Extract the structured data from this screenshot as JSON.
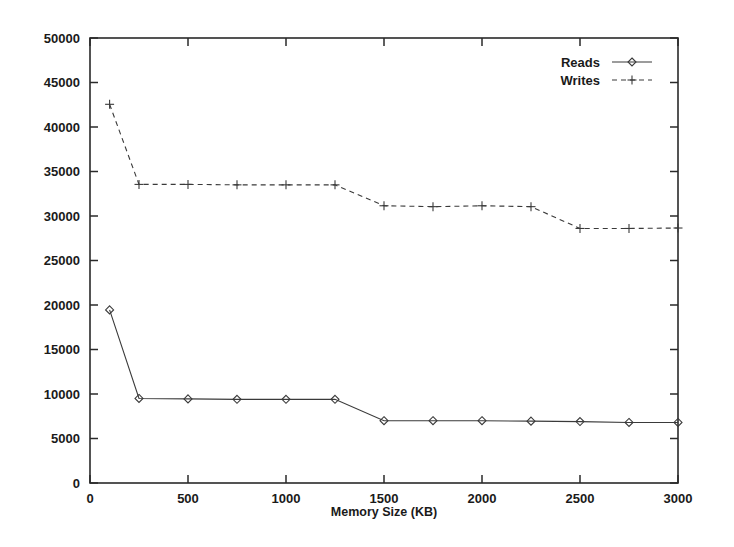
{
  "chart_data": {
    "type": "line",
    "title": "",
    "xlabel": "Memory Size (KB)",
    "ylabel": "",
    "xlim": [
      0,
      3000
    ],
    "ylim": [
      0,
      50000
    ],
    "grid": false,
    "legend_position": "top-right-inside",
    "xticks": [
      0,
      500,
      1000,
      1500,
      2000,
      2500,
      3000
    ],
    "xtick_labels": [
      "0",
      "500",
      "1000",
      "1500",
      "2000",
      "2500",
      "3000"
    ],
    "yticks": [
      0,
      5000,
      10000,
      15000,
      20000,
      25000,
      30000,
      35000,
      40000,
      45000,
      50000
    ],
    "ytick_labels": [
      "0",
      "5000",
      "10000",
      "15000",
      "20000",
      "25000",
      "30000",
      "35000",
      "40000",
      "45000",
      "50000"
    ],
    "x": [
      100,
      250,
      500,
      750,
      1000,
      1250,
      1500,
      1750,
      2000,
      2250,
      2500,
      2750,
      3000
    ],
    "series": [
      {
        "name": "Reads",
        "marker": "diamond",
        "linestyle": "solid",
        "color": "#3a3a3a",
        "values": [
          19450,
          9500,
          9450,
          9400,
          9400,
          9400,
          7000,
          7000,
          7000,
          6950,
          6900,
          6800,
          6800
        ]
      },
      {
        "name": "Writes",
        "marker": "plus",
        "linestyle": "dashed",
        "color": "#3a3a3a",
        "values": [
          42550,
          33550,
          33550,
          33500,
          33500,
          33500,
          31150,
          31050,
          31150,
          31050,
          28600,
          28600,
          28650
        ]
      }
    ]
  },
  "legend": {
    "entries": [
      {
        "label": "Reads"
      },
      {
        "label": "Writes"
      }
    ]
  },
  "axes": {
    "x_title": "Memory Size (KB)"
  }
}
